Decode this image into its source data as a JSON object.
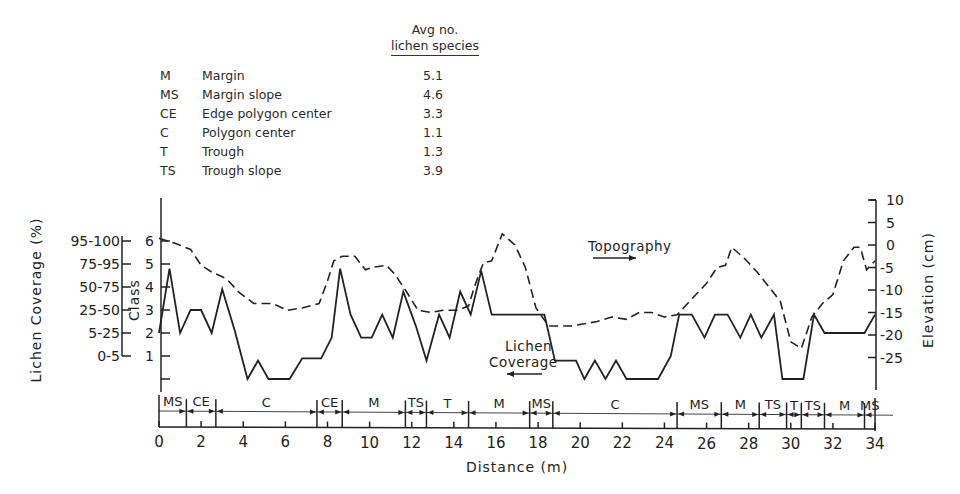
{
  "legend": {
    "header_line1": "Avg no.",
    "header_line2": "lichen species",
    "rows": [
      {
        "code": "M",
        "name": "Margin",
        "avg": "5.1"
      },
      {
        "code": "MS",
        "name": "Margin slope",
        "avg": "4.6"
      },
      {
        "code": "CE",
        "name": "Edge polygon center",
        "avg": "3.3"
      },
      {
        "code": "C",
        "name": "Polygon center",
        "avg": "1.1"
      },
      {
        "code": "T",
        "name": "Trough",
        "avg": "1.3"
      },
      {
        "code": "TS",
        "name": "Trough slope",
        "avg": "3.9"
      }
    ]
  },
  "axes": {
    "coverage_label": "Lichen Coverage (%)",
    "coverage_ticks": [
      "95-100",
      "75-95",
      "50-75",
      "25-50",
      "5-25",
      "0-5"
    ],
    "class_label": "Class",
    "class_ticks": [
      "6",
      "5",
      "4",
      "3",
      "2",
      "1"
    ],
    "elevation_label": "Elevation (cm)",
    "elevation_ticks": [
      "10",
      "5",
      "0",
      "-5",
      "-10",
      "-15",
      "-20",
      "-25"
    ],
    "x_label": "Distance (m)",
    "x_ticks": [
      "0",
      "2",
      "4",
      "6",
      "8",
      "10",
      "12",
      "14",
      "16",
      "18",
      "20",
      "22",
      "24",
      "26",
      "28",
      "30",
      "32",
      "34"
    ]
  },
  "annotations": {
    "topography": "Topography",
    "lichen_line1": "Lichen",
    "lichen_line2": "Coverage"
  },
  "chart_data": {
    "type": "line",
    "title": "",
    "xlabel": "Distance (m)",
    "ylabel": "Class (Lichen Coverage %)",
    "y2label": "Elevation (cm)",
    "xlim": [
      0,
      34
    ],
    "ylim": [
      0,
      6
    ],
    "y2lim": [
      -28,
      10
    ],
    "grid": false,
    "coverage_class_map": {
      "1": "0-5",
      "2": "5-25",
      "3": "25-50",
      "4": "50-75",
      "5": "75-95",
      "6": "95-100"
    },
    "series": [
      {
        "name": "Lichen Coverage",
        "axis": "class",
        "style": "solid",
        "x": [
          0,
          0.5,
          1.0,
          1.5,
          2.0,
          2.5,
          3.0,
          3.6,
          4.2,
          4.7,
          5.2,
          6.2,
          6.8,
          7.7,
          8.2,
          8.6,
          9.1,
          9.6,
          10.1,
          10.6,
          11.1,
          11.6,
          12.2,
          12.7,
          13.3,
          13.8,
          14.3,
          14.8,
          15.3,
          15.8,
          16.3,
          18.3,
          18.8,
          19.8,
          20.2,
          20.7,
          21.2,
          21.7,
          22.2,
          22.7,
          23.7,
          24.3,
          24.7,
          25.3,
          25.9,
          26.4,
          27.0,
          27.6,
          28.1,
          28.6,
          29.2,
          29.6,
          30.6,
          31.1,
          31.6,
          33.5,
          34.0
        ],
        "values": [
          2.0,
          4.8,
          2.0,
          3.0,
          3.0,
          2.0,
          3.9,
          2.1,
          0.0,
          0.8,
          0.0,
          0.0,
          0.9,
          0.9,
          1.8,
          4.8,
          2.8,
          1.8,
          1.8,
          2.8,
          1.8,
          3.8,
          2.3,
          0.8,
          2.8,
          1.8,
          3.8,
          2.8,
          4.7,
          2.8,
          2.8,
          2.8,
          0.8,
          0.8,
          0.0,
          0.8,
          0.0,
          0.8,
          0.0,
          0.0,
          0.0,
          1.0,
          2.8,
          2.8,
          1.8,
          2.8,
          2.8,
          1.8,
          2.8,
          1.8,
          2.8,
          0.0,
          0.0,
          2.8,
          2.0,
          2.0,
          2.8
        ]
      },
      {
        "name": "Topography",
        "axis": "elevation",
        "style": "dashed",
        "x": [
          0,
          0.7,
          1.5,
          2.0,
          2.5,
          3.2,
          3.8,
          4.5,
          5.4,
          6.1,
          6.8,
          7.6,
          8.0,
          8.3,
          8.7,
          9.3,
          9.8,
          10.1,
          10.8,
          11.2,
          11.7,
          12.3,
          12.9,
          13.5,
          14.2,
          14.7,
          15.0,
          15.4,
          15.8,
          16.3,
          16.9,
          17.4,
          17.9,
          18.5,
          19.0,
          19.6,
          20.2,
          20.8,
          21.5,
          22.2,
          22.8,
          23.4,
          24.0,
          24.6,
          25.4,
          26.0,
          26.5,
          26.9,
          27.2,
          27.8,
          28.4,
          29.0,
          29.5,
          30.0,
          30.5,
          31.0,
          31.5,
          32.0,
          32.5,
          33.0,
          33.3,
          33.6,
          34.0
        ],
        "values": [
          1.5,
          0.5,
          -1.0,
          -4.5,
          -6.0,
          -7.5,
          -10.5,
          -13.0,
          -13.0,
          -14.5,
          -14.0,
          -13.0,
          -8.0,
          -3.5,
          -2.5,
          -2.5,
          -5.5,
          -5.0,
          -4.5,
          -6.5,
          -10.0,
          -14.5,
          -15.0,
          -14.5,
          -14.5,
          -13.5,
          -9.0,
          -4.0,
          -3.5,
          2.5,
          0.0,
          -5.0,
          -14.0,
          -18.0,
          -18.0,
          -18.0,
          -17.5,
          -17.0,
          -16.0,
          -16.5,
          -15.0,
          -15.0,
          -16.0,
          -15.5,
          -11.5,
          -8.5,
          -5.0,
          -4.5,
          -0.5,
          -3.0,
          -6.0,
          -9.5,
          -12.5,
          -21.5,
          -23.0,
          -16.0,
          -13.0,
          -11.0,
          -3.5,
          -0.5,
          -0.5,
          -5.5,
          -3.5
        ]
      }
    ],
    "zones": [
      {
        "label": "MS",
        "start": 0,
        "end": 1.3
      },
      {
        "label": "CE",
        "start": 1.3,
        "end": 2.7
      },
      {
        "label": "C",
        "start": 2.7,
        "end": 7.5
      },
      {
        "label": "CE",
        "start": 7.5,
        "end": 8.7
      },
      {
        "label": "M",
        "start": 8.7,
        "end": 11.7
      },
      {
        "label": "TS",
        "start": 11.7,
        "end": 12.7
      },
      {
        "label": "T",
        "start": 12.7,
        "end": 14.7
      },
      {
        "label": "M",
        "start": 14.7,
        "end": 17.6
      },
      {
        "label": "MS",
        "start": 17.6,
        "end": 18.7
      },
      {
        "label": "C",
        "start": 18.7,
        "end": 24.6
      },
      {
        "label": "MS",
        "start": 24.6,
        "end": 26.7
      },
      {
        "label": "M",
        "start": 26.7,
        "end": 28.5
      },
      {
        "label": "TS",
        "start": 28.5,
        "end": 29.8
      },
      {
        "label": "T",
        "start": 29.8,
        "end": 30.5
      },
      {
        "label": "TS",
        "start": 30.5,
        "end": 31.6
      },
      {
        "label": "M",
        "start": 31.6,
        "end": 33.5
      },
      {
        "label": "MS",
        "start": 33.5,
        "end": 34.0
      }
    ]
  }
}
